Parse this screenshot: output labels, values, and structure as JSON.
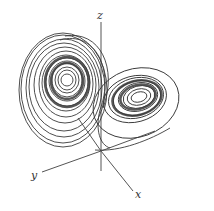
{
  "figure": {
    "type": "Lorenz attractor (3D phase portrait)",
    "axes": {
      "z_label": "z",
      "y_label": "y",
      "x_label": "x"
    },
    "colors": {
      "trajectory": "#3a3a3a",
      "axis": "#555555",
      "background": "#ffffff"
    }
  }
}
